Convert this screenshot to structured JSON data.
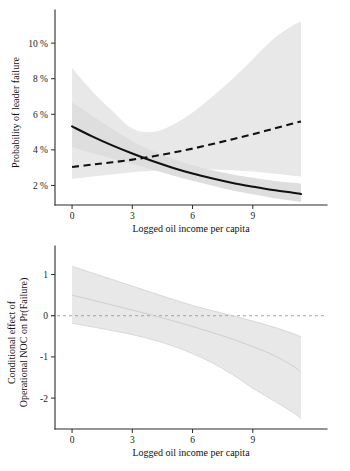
{
  "figure": {
    "background": "#ffffff",
    "panels": [
      "top",
      "bottom"
    ]
  },
  "chart_data": [
    {
      "id": "panel-top",
      "type": "line",
      "title": "",
      "xlabel": "Logged oil income per capita",
      "ylabel": "Probability of leader failure",
      "xlim": [
        -0.85,
        11.6
      ],
      "ylim": [
        0.9,
        11.3
      ],
      "xticks": [
        0,
        3,
        6,
        9
      ],
      "xticklabels": [
        "0",
        "3",
        "6",
        "9"
      ],
      "yticks": [
        2,
        4,
        6,
        8,
        10
      ],
      "yticklabels": [
        "2 %",
        "4 %",
        "6 %",
        "8 %",
        "10 %"
      ],
      "grid": false,
      "legend": "none",
      "accent_solid": "#111111",
      "accent_dashed": "#111111",
      "band_color": "#e8e8e8",
      "x": [
        0,
        1,
        2,
        3,
        4,
        5,
        6,
        7,
        8,
        9,
        10,
        11,
        11.4
      ],
      "series": [
        {
          "name": "No operational NOC",
          "style": "solid",
          "values": [
            5.32,
            4.76,
            4.25,
            3.79,
            3.37,
            3.0,
            2.67,
            2.39,
            2.14,
            1.93,
            1.74,
            1.59,
            1.52
          ],
          "ci_lower": [
            4.15,
            3.82,
            3.5,
            3.2,
            2.88,
            2.56,
            2.26,
            1.98,
            1.72,
            1.5,
            1.3,
            1.14,
            1.08
          ],
          "ci_upper": [
            6.68,
            5.92,
            5.17,
            4.49,
            3.94,
            3.5,
            3.14,
            2.86,
            2.62,
            2.43,
            2.27,
            2.15,
            2.1
          ]
        },
        {
          "name": "Operational NOC",
          "style": "dashed",
          "values": [
            3.04,
            3.17,
            3.3,
            3.45,
            3.63,
            3.84,
            4.07,
            4.33,
            4.6,
            4.88,
            5.18,
            5.48,
            5.6
          ],
          "ci_lower": [
            2.36,
            2.5,
            2.62,
            2.74,
            2.82,
            2.88,
            2.91,
            2.9,
            2.86,
            2.78,
            2.67,
            2.55,
            2.5
          ],
          "ci_upper": [
            8.6,
            7.3,
            6.2,
            5.2,
            5.0,
            5.4,
            6.1,
            7.0,
            8.0,
            9.1,
            10.2,
            11.0,
            11.2
          ]
        }
      ]
    },
    {
      "id": "panel-bottom",
      "type": "line",
      "title": "",
      "xlabel": "Logged oil income per capita",
      "ylabel": "Conditional effect of Operational NOC on Pr(Failure)",
      "ylabel_line1": "Conditional effect of",
      "ylabel_line2": "Operational NOC on Pr(Failure)",
      "xlim": [
        -0.85,
        11.6
      ],
      "ylim": [
        -2.75,
        1.45
      ],
      "xticks": [
        0,
        3,
        6,
        9
      ],
      "xticklabels": [
        "0",
        "3",
        "6",
        "9"
      ],
      "yticks": [
        1,
        0,
        -1,
        -2
      ],
      "yticklabels": [
        "1",
        "0",
        "-1",
        "-2"
      ],
      "grid": false,
      "legend": "none",
      "zero_reference": 0,
      "band_color": "#ededed",
      "x": [
        0,
        1,
        2,
        3,
        4,
        5,
        6,
        7,
        8,
        9,
        10,
        11,
        11.4
      ],
      "series": [
        {
          "name": "Marginal effect",
          "style": "line",
          "values": [
            0.5,
            0.38,
            0.26,
            0.14,
            0.01,
            -0.12,
            -0.26,
            -0.41,
            -0.57,
            -0.75,
            -0.95,
            -1.22,
            -1.38
          ],
          "ci_lower": [
            -0.18,
            -0.27,
            -0.36,
            -0.46,
            -0.58,
            -0.73,
            -0.92,
            -1.15,
            -1.43,
            -1.76,
            -2.05,
            -2.35,
            -2.5
          ],
          "ci_upper": [
            1.2,
            1.04,
            0.88,
            0.72,
            0.56,
            0.4,
            0.25,
            0.12,
            0.0,
            -0.13,
            -0.27,
            -0.43,
            -0.51
          ]
        }
      ]
    }
  ]
}
